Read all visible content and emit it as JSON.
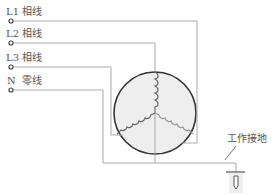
{
  "diagram": {
    "lines": [
      {
        "id": "L1",
        "name": "L1",
        "type": "相线"
      },
      {
        "id": "L2",
        "name": "L2",
        "type": "相线"
      },
      {
        "id": "L3",
        "name": "L3",
        "type": "相线"
      },
      {
        "id": "N",
        "name": "N",
        "type": "零线"
      }
    ],
    "ground_label": "工作接地",
    "colors": {
      "wire": "#aaaaaa",
      "circle_fill": "#eeeeee",
      "circle_stroke": "#333333",
      "coil": "#777777",
      "text": "#555555"
    }
  }
}
